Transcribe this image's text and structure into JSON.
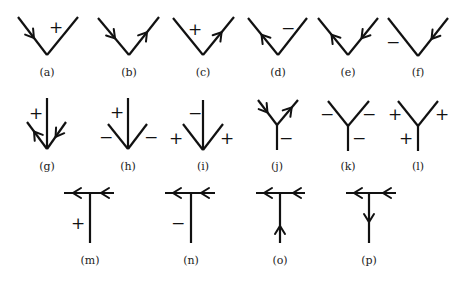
{
  "figures": [
    {
      "id": "a",
      "label": "(a)",
      "type": "V",
      "left": [
        18,
        17
      ],
      "vertex": [
        47,
        55
      ],
      "right": [
        78,
        17
      ],
      "arrows": [
        {
          "on": "left",
          "t": 0.55,
          "dir": "toward-vertex"
        }
      ],
      "signs": [
        {
          "text": "+",
          "x": 56,
          "y": 27
        }
      ],
      "caption_pos": [
        47,
        72
      ]
    },
    {
      "id": "b",
      "label": "(b)",
      "type": "V",
      "left": [
        98,
        18
      ],
      "vertex": [
        129,
        55
      ],
      "right": [
        159,
        17
      ],
      "arrows": [
        {
          "on": "left",
          "t": 0.55,
          "dir": "toward-vertex"
        },
        {
          "on": "right",
          "t": 0.6,
          "dir": "away-from-vertex"
        }
      ],
      "signs": [],
      "caption_pos": [
        129,
        72
      ]
    },
    {
      "id": "c",
      "label": "(c)",
      "type": "V",
      "left": [
        173,
        18
      ],
      "vertex": [
        203,
        55
      ],
      "right": [
        234,
        17
      ],
      "arrows": [
        {
          "on": "right",
          "t": 0.6,
          "dir": "away-from-vertex"
        }
      ],
      "signs": [
        {
          "text": "+",
          "x": 195,
          "y": 29
        }
      ],
      "caption_pos": [
        203,
        72
      ]
    },
    {
      "id": "d",
      "label": "(d)",
      "type": "V",
      "left": [
        248,
        18
      ],
      "vertex": [
        278,
        55
      ],
      "right": [
        307,
        18
      ],
      "arrows": [
        {
          "on": "left",
          "t": 0.55,
          "dir": "away-from-vertex"
        }
      ],
      "signs": [
        {
          "text": "−",
          "x": 288,
          "y": 28
        }
      ],
      "caption_pos": [
        278,
        72
      ]
    },
    {
      "id": "e",
      "label": "(e)",
      "type": "V",
      "left": [
        318,
        18
      ],
      "vertex": [
        348,
        55
      ],
      "right": [
        378,
        18
      ],
      "arrows": [
        {
          "on": "left",
          "t": 0.55,
          "dir": "away-from-vertex"
        },
        {
          "on": "right",
          "t": 0.55,
          "dir": "toward-vertex"
        }
      ],
      "signs": [],
      "caption_pos": [
        348,
        72
      ]
    },
    {
      "id": "f",
      "label": "(f)",
      "type": "V",
      "left": [
        388,
        18
      ],
      "vertex": [
        418,
        56
      ],
      "right": [
        448,
        18
      ],
      "arrows": [
        {
          "on": "right",
          "t": 0.55,
          "dir": "toward-vertex"
        }
      ],
      "signs": [
        {
          "text": "−",
          "x": 393,
          "y": 42
        }
      ],
      "caption_pos": [
        418,
        72
      ]
    },
    {
      "id": "g",
      "label": "(g)",
      "type": "arrow-junction",
      "stem_top": [
        47,
        98
      ],
      "vertex": [
        47,
        149
      ],
      "left": [
        27,
        122
      ],
      "right": [
        66,
        122
      ],
      "arrows": [
        {
          "on": "left",
          "t": 0.65,
          "dir": "away-from-vertex"
        },
        {
          "on": "right",
          "t": 0.55,
          "dir": "toward-vertex"
        }
      ],
      "signs": [
        {
          "text": "+",
          "x": 36,
          "y": 113
        }
      ],
      "caption_pos": [
        47,
        166
      ]
    },
    {
      "id": "h",
      "label": "(h)",
      "type": "arrow-junction",
      "stem_top": [
        128,
        98
      ],
      "vertex": [
        128,
        149
      ],
      "left": [
        108,
        124
      ],
      "right": [
        147,
        124
      ],
      "arrows": [],
      "signs": [
        {
          "text": "+",
          "x": 117,
          "y": 112
        },
        {
          "text": "−",
          "x": 106,
          "y": 137
        },
        {
          "text": "−",
          "x": 151,
          "y": 137
        }
      ],
      "caption_pos": [
        128,
        166
      ]
    },
    {
      "id": "i",
      "label": "(i)",
      "type": "arrow-junction",
      "stem_top": [
        203,
        100
      ],
      "vertex": [
        203,
        150
      ],
      "left": [
        183,
        124
      ],
      "right": [
        223,
        124
      ],
      "arrows": [],
      "signs": [
        {
          "text": "−",
          "x": 195,
          "y": 113
        },
        {
          "text": "+",
          "x": 176,
          "y": 138
        },
        {
          "text": "+",
          "x": 227,
          "y": 138
        }
      ],
      "caption_pos": [
        203,
        166
      ]
    },
    {
      "id": "j",
      "label": "(j)",
      "type": "Y",
      "left": [
        258,
        100
      ],
      "junction": [
        277,
        125
      ],
      "right": [
        298,
        100
      ],
      "stem_bottom": [
        277,
        150
      ],
      "arrows": [
        {
          "on": "left",
          "t": 0.5,
          "dir": "toward-vertex"
        },
        {
          "on": "right",
          "t": 0.7,
          "dir": "away-from-vertex"
        }
      ],
      "signs": [
        {
          "text": "−",
          "x": 286,
          "y": 138
        }
      ],
      "caption_pos": [
        277,
        166
      ]
    },
    {
      "id": "k",
      "label": "(k)",
      "type": "Y",
      "left": [
        328,
        101
      ],
      "junction": [
        348,
        126
      ],
      "right": [
        369,
        101
      ],
      "stem_bottom": [
        348,
        151
      ],
      "arrows": [],
      "signs": [
        {
          "text": "−",
          "x": 327,
          "y": 114
        },
        {
          "text": "−",
          "x": 369,
          "y": 114
        },
        {
          "text": "−",
          "x": 359,
          "y": 138
        }
      ],
      "caption_pos": [
        348,
        166
      ]
    },
    {
      "id": "l",
      "label": "(l)",
      "type": "Y",
      "left": [
        398,
        101
      ],
      "junction": [
        418,
        126
      ],
      "right": [
        438,
        101
      ],
      "stem_bottom": [
        418,
        151
      ],
      "arrows": [],
      "signs": [
        {
          "text": "+",
          "x": 395,
          "y": 114
        },
        {
          "text": "+",
          "x": 442,
          "y": 114
        },
        {
          "text": "+",
          "x": 406,
          "y": 138
        }
      ],
      "caption_pos": [
        418,
        166
      ]
    },
    {
      "id": "m",
      "label": "(m)",
      "type": "T",
      "bar_left": [
        64,
        193
      ],
      "bar_right": [
        114,
        193
      ],
      "stem_bottom": [
        90,
        243
      ],
      "bar_arrows": [
        {
          "x": 73,
          "dir": "left"
        },
        {
          "x": 101,
          "dir": "left"
        }
      ],
      "stem_arrow": null,
      "signs": [
        {
          "text": "+",
          "x": 78,
          "y": 223
        }
      ],
      "caption_pos": [
        90,
        260
      ]
    },
    {
      "id": "n",
      "label": "(n)",
      "type": "T",
      "bar_left": [
        165,
        193
      ],
      "bar_right": [
        215,
        193
      ],
      "stem_bottom": [
        191,
        243
      ],
      "bar_arrows": [
        {
          "x": 173,
          "dir": "left"
        },
        {
          "x": 201,
          "dir": "left"
        }
      ],
      "stem_arrow": null,
      "signs": [
        {
          "text": "−",
          "x": 178,
          "y": 223
        }
      ],
      "caption_pos": [
        191,
        260
      ]
    },
    {
      "id": "o",
      "label": "(o)",
      "type": "T",
      "bar_left": [
        256,
        193
      ],
      "bar_right": [
        305,
        193
      ],
      "stem_bottom": [
        280,
        243
      ],
      "bar_arrows": [
        {
          "x": 264,
          "dir": "left"
        },
        {
          "x": 293,
          "dir": "left"
        }
      ],
      "stem_arrow": {
        "y": 226,
        "dir": "up"
      },
      "signs": [],
      "caption_pos": [
        280,
        260
      ]
    },
    {
      "id": "p",
      "label": "(p)",
      "type": "T",
      "bar_left": [
        346,
        193
      ],
      "bar_right": [
        396,
        193
      ],
      "stem_bottom": [
        369,
        243
      ],
      "bar_arrows": [
        {
          "x": 354,
          "dir": "left"
        },
        {
          "x": 383,
          "dir": "left"
        }
      ],
      "stem_arrow": {
        "y": 222,
        "dir": "down"
      },
      "signs": [],
      "caption_pos": [
        369,
        260
      ]
    }
  ]
}
